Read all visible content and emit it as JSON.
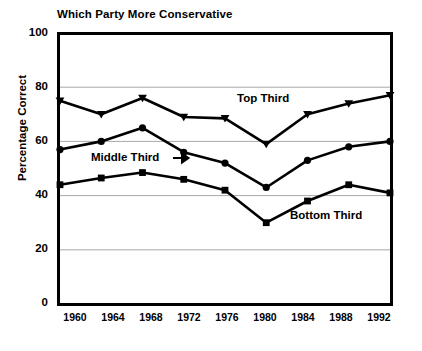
{
  "chart_data": {
    "type": "line",
    "title": "Which Party More Conservative",
    "xlabel": "",
    "ylabel": "Percentage Correct",
    "categories": [
      "1960",
      "1964",
      "1968",
      "1972",
      "1976",
      "1980",
      "1984",
      "1988",
      "1992"
    ],
    "x": [
      1960,
      1964,
      1968,
      1972,
      1976,
      1980,
      1984,
      1988,
      1992
    ],
    "ylim": [
      0,
      100
    ],
    "yticks": [
      0,
      20,
      40,
      60,
      80,
      100
    ],
    "grid": true,
    "legend": "inline-annotations",
    "series": [
      {
        "name": "Top Third",
        "marker": "triangle",
        "values": [
          75,
          70,
          76,
          69,
          68.5,
          59,
          70,
          74,
          77
        ]
      },
      {
        "name": "Middle Third",
        "marker": "circle",
        "values": [
          57,
          60,
          65,
          56,
          52,
          43,
          53,
          58,
          60
        ]
      },
      {
        "name": "Bottom Third",
        "marker": "square",
        "values": [
          44,
          46.5,
          48.5,
          46,
          42,
          30,
          38,
          44,
          41
        ]
      }
    ],
    "annotations": [
      {
        "text": "Top Third",
        "series": "Top Third"
      },
      {
        "text": "Middle Third",
        "series": "Middle Third",
        "arrow": "→"
      },
      {
        "text": "Bottom Third",
        "series": "Bottom Third"
      }
    ],
    "colors": {
      "line": "#000000",
      "marker": "#000000",
      "grid": "#a8a8a8",
      "axis": "#000000",
      "background": "#ffffff"
    }
  },
  "y_tick_labels": [
    "100",
    "80",
    "60",
    "40",
    "20",
    "0"
  ],
  "annotation_text": {
    "top": "Top Third",
    "middle": "Middle Third",
    "middle_arrow": "→",
    "bottom": "Bottom Third"
  }
}
